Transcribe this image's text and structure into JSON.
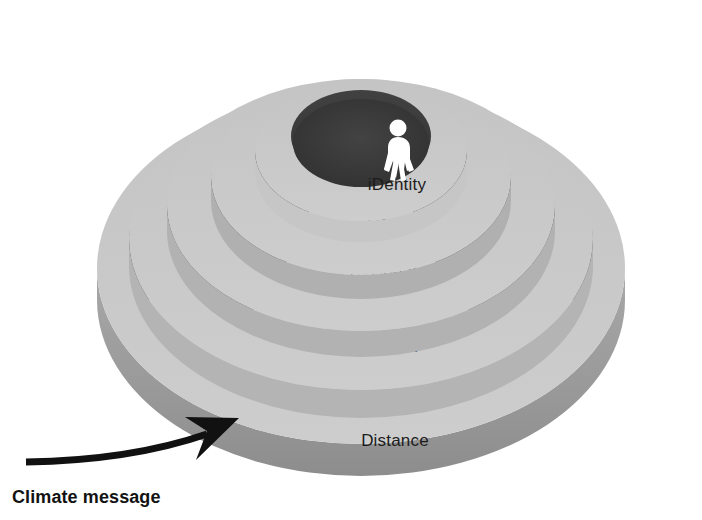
{
  "figure": {
    "background_color": "#ffffff",
    "palette": {
      "top_surface": "#c9c9c9",
      "top_surface_light": "#d0d0d0",
      "inner_wall_dark": "#3c3c3c",
      "inner_wall_darker": "#2e2e2e",
      "outer_side_wall": "#9a9a9a",
      "rim_highlight": "#bdbdbd",
      "center_top": "#3a3a3a",
      "label_color": "#1c1c1c",
      "arrow_color": "#111111",
      "person_color": "#ffffff"
    },
    "tiers": [
      {
        "id": "distance",
        "label": "Distance",
        "level": 1,
        "label_x": 395,
        "label_y": 446
      },
      {
        "id": "doom",
        "label": "Doom",
        "level": 2,
        "label_x": 395,
        "label_y": 352
      },
      {
        "id": "dissonance",
        "label": "Dissonance",
        "level": 3,
        "label_x": 395,
        "label_y": 277
      },
      {
        "id": "denial",
        "label": "Denial",
        "level": 4,
        "label_x": 392,
        "label_y": 228
      },
      {
        "id": "identity",
        "label": "iDentity",
        "level": 5,
        "label_x": 397,
        "label_y": 190
      }
    ],
    "person_icon": {
      "name": "person-figure-icon",
      "description": "white standing human figure at the centre of the innermost tier"
    },
    "annotation": {
      "id": "climate-message",
      "label": "Climate message",
      "label_x": 12,
      "label_y": 503,
      "arrow": {
        "name": "curved-arrow-icon",
        "description": "curved arrow pointing up-right into the outer Distance ring"
      }
    }
  }
}
